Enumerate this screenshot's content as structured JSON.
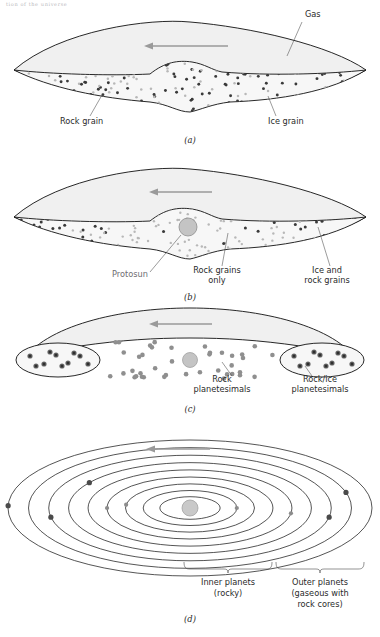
{
  "page_header": "tion of the universe",
  "diagram": {
    "colors": {
      "gas_fill": "#f0f0f0",
      "disk_fill": "#f7f7f7",
      "rock_grain": "#3a3a3a",
      "ice_grain": "#b8b8b8",
      "protosun": "#c4c4c4",
      "arrow": "#9a9a9a",
      "outline": "#1c1c1c"
    },
    "panels": [
      {
        "id": "a",
        "caption": "(a)",
        "shape": "lens-nebula",
        "arrow_direction": "left",
        "labels": [
          {
            "name": "gas",
            "text": "Gas",
            "x": 305,
            "y": 17,
            "anchor": "start"
          },
          {
            "name": "rock-grain",
            "text": "Rock grain",
            "x": 60,
            "y": 124,
            "anchor": "start"
          },
          {
            "name": "ice-grain",
            "text": "Ice grain",
            "x": 268,
            "y": 124,
            "anchor": "start"
          }
        ]
      },
      {
        "id": "b",
        "caption": "(b)",
        "shape": "lens-nebula-with-protosun",
        "arrow_direction": "left",
        "labels": [
          {
            "name": "protosun",
            "text": "Protosun",
            "x": 112,
            "y": 122,
            "anchor": "start"
          },
          {
            "name": "rock-grains-only-1",
            "text": "Rock grains",
            "x": 217,
            "y": 118,
            "anchor": "middle"
          },
          {
            "name": "rock-grains-only-2",
            "text": "only",
            "x": 217,
            "y": 128,
            "anchor": "middle"
          },
          {
            "name": "ice-and-rock-1",
            "text": "Ice and",
            "x": 327,
            "y": 118,
            "anchor": "middle"
          },
          {
            "name": "ice-and-rock-2",
            "text": "rock grains",
            "x": 327,
            "y": 128,
            "anchor": "middle"
          }
        ]
      },
      {
        "id": "c",
        "caption": "(c)",
        "shape": "crescent-with-lobes",
        "arrow_direction": "left",
        "labels": [
          {
            "name": "rock-planetesimals-1",
            "text": "Rock",
            "x": 222,
            "y": 82,
            "anchor": "middle"
          },
          {
            "name": "rock-planetesimals-2",
            "text": "planetesimals",
            "x": 222,
            "y": 92,
            "anchor": "middle"
          },
          {
            "name": "rock-ice-planetesimals-1",
            "text": "Rock/ice",
            "x": 320,
            "y": 82,
            "anchor": "middle"
          },
          {
            "name": "rock-ice-planetesimals-2",
            "text": "planetesimals",
            "x": 320,
            "y": 92,
            "anchor": "middle"
          }
        ]
      },
      {
        "id": "d",
        "caption": "(d)",
        "shape": "concentric-orbits",
        "arrow_direction": "left",
        "orbit_count": 9,
        "labels": [
          {
            "name": "inner-planets-1",
            "text": "Inner planets",
            "x": 228,
            "y": 155,
            "anchor": "middle"
          },
          {
            "name": "inner-planets-2",
            "text": "(rocky)",
            "x": 228,
            "y": 166,
            "anchor": "middle"
          },
          {
            "name": "outer-planets-1",
            "text": "Outer planets",
            "x": 320,
            "y": 155,
            "anchor": "middle"
          },
          {
            "name": "outer-planets-2",
            "text": "(gaseous with",
            "x": 320,
            "y": 166,
            "anchor": "middle"
          },
          {
            "name": "outer-planets-3",
            "text": "rock cores)",
            "x": 320,
            "y": 177,
            "anchor": "middle"
          }
        ]
      }
    ]
  }
}
